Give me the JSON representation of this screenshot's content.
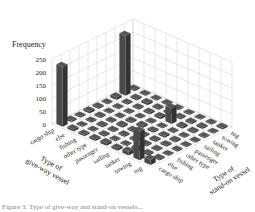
{
  "chart_data": {
    "type": "bar3d",
    "title": "",
    "zlabel": "Frequency",
    "xlabel": "Type of give-way vessel",
    "ylabel": "Type of stand-on vessel",
    "z_ticks": [
      0,
      50,
      100,
      150,
      200,
      250
    ],
    "zlim": [
      0,
      250
    ],
    "grid": true,
    "give_way_categories": [
      "cargo ship",
      "else",
      "fishing",
      "other type",
      "passenger",
      "sailing",
      "tanker",
      "towing",
      "tug"
    ],
    "stand_on_categories": [
      "cargo ship",
      "else",
      "fishing",
      "other type",
      "passenger",
      "sailing",
      "tanker",
      "towing",
      "tug"
    ],
    "values": [
      [
        230,
        6,
        5,
        8,
        6,
        4,
        10,
        230,
        6
      ],
      [
        8,
        4,
        4,
        6,
        4,
        4,
        5,
        6,
        4
      ],
      [
        6,
        4,
        6,
        5,
        4,
        4,
        5,
        8,
        4
      ],
      [
        7,
        5,
        5,
        8,
        6,
        4,
        6,
        6,
        5
      ],
      [
        10,
        4,
        6,
        6,
        8,
        4,
        8,
        6,
        4
      ],
      [
        8,
        4,
        6,
        5,
        6,
        4,
        60,
        6,
        4
      ],
      [
        14,
        8,
        6,
        6,
        6,
        4,
        8,
        6,
        4
      ],
      [
        110,
        6,
        5,
        6,
        6,
        4,
        6,
        6,
        4
      ],
      [
        20,
        6,
        4,
        4,
        4,
        4,
        4,
        4,
        6
      ]
    ],
    "bar_color": "#3d3d3d",
    "grid_color": "#cfcfcf",
    "partial_caption_visible": true
  },
  "caption": "Figure 3. Type of give-way and stand-on vessels..."
}
